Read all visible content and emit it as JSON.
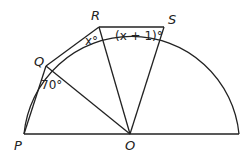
{
  "diagram": {
    "type": "semicircle geometry",
    "points": {
      "P": {
        "label": "P"
      },
      "Q": {
        "label": "Q"
      },
      "R": {
        "label": "R"
      },
      "S": {
        "label": "S"
      },
      "O": {
        "label": "O"
      }
    },
    "angles": {
      "PQO": "70°",
      "QRO": "x°",
      "RSO": "(x + 1)°"
    },
    "segments": [
      "PQ",
      "QR",
      "RS",
      "PO",
      "QO",
      "RO",
      "SO",
      "diameter"
    ]
  }
}
